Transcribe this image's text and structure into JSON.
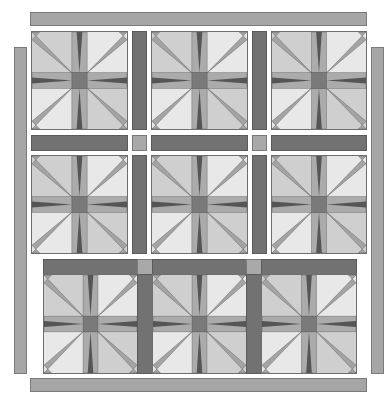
{
  "diagram": {
    "type": "quilt-layout",
    "colors": {
      "border_strip": "#a6a6a6",
      "sashing": "#727272",
      "cornerstone": "#a9a9a9",
      "block_light": "#e8e8e8",
      "block_medium": "#cdcdcd",
      "block_bar": "#a8a8a8",
      "block_center": "#7a7a7a",
      "block_spike_dark": "#555555",
      "block_spike_diag": "#a0a0a0"
    },
    "rows": [
      {
        "name": "row-1",
        "blocks": 3,
        "sashing_between": 2
      },
      {
        "name": "row-2",
        "blocks": 3,
        "sashing_between": 2
      },
      {
        "name": "row-3",
        "blocks": 3,
        "sashing_between": 2,
        "top_sashing_with_cornerstones": true
      }
    ],
    "horizontal_sashing_row": {
      "strips": 3,
      "cornerstones": 2
    },
    "borders": [
      "top",
      "left",
      "right",
      "bottom"
    ]
  }
}
